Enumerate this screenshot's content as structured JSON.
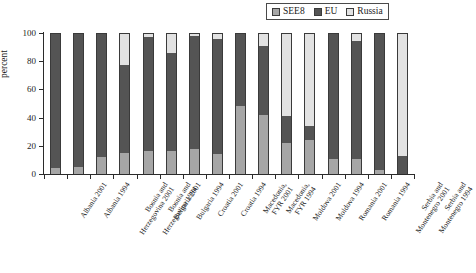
{
  "chart_data": {
    "type": "bar",
    "title": "",
    "subtitle": "",
    "xlabel": "",
    "ylabel": "percent",
    "ylim": [
      0,
      100
    ],
    "yticks": [
      0,
      20,
      40,
      60,
      80,
      100
    ],
    "grid": false,
    "stacked": true,
    "legend_position": "top-right",
    "categories": [
      "Albania 2001",
      "Albania 1994",
      "Bosnia and Herzegovina 2001",
      "Bosnia and Herzegovina 1994",
      "Bulgaria 2001",
      "Bulgaria 1994",
      "Croatia 2001",
      "Croatia 1994",
      "Macedonia, FYR 2001",
      "Macedonia, FYR 1994",
      "Moldova 2001",
      "Moldova 1994",
      "Romania 2001",
      "Romania 1994",
      "Serbia and Montenegro 2001",
      "Serbia and Montenegro 1994"
    ],
    "series": [
      {
        "name": "SEE8",
        "color": "#a6a6a6",
        "values": [
          4,
          5,
          12,
          15,
          16,
          16,
          18,
          14,
          48,
          42,
          22,
          24,
          11,
          11,
          3,
          0
        ]
      },
      {
        "name": "EU",
        "color": "#545454",
        "values": [
          96,
          95,
          88,
          62,
          81,
          70,
          80,
          82,
          52,
          49,
          19,
          10,
          89,
          83,
          97,
          13
        ]
      },
      {
        "name": "Russia",
        "color": "#e2e2e2",
        "values": [
          0,
          0,
          0,
          23,
          3,
          14,
          2,
          4,
          0,
          9,
          59,
          66,
          0,
          6,
          0,
          87
        ]
      }
    ],
    "legend": [
      {
        "label": "SEE8",
        "color": "#a6a6a6"
      },
      {
        "label": "EU",
        "color": "#545454"
      },
      {
        "label": "Russia",
        "color": "#e2e2e2"
      }
    ]
  }
}
